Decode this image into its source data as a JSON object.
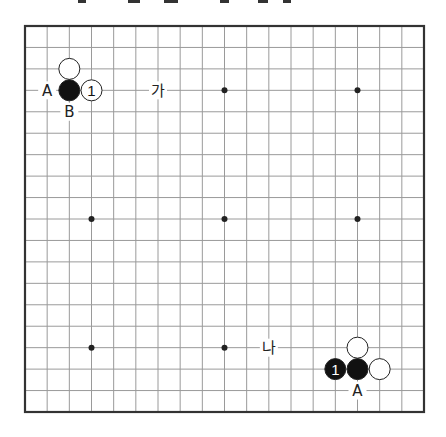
{
  "diagram": {
    "type": "go-board",
    "size": 19,
    "board": {
      "left": 25,
      "top": 26,
      "right": 424,
      "bottom": 412,
      "line_color": "#9a9a9a",
      "border_color": "#333333"
    },
    "star_points": [
      [
        3,
        3
      ],
      [
        9,
        3
      ],
      [
        15,
        3
      ],
      [
        3,
        9
      ],
      [
        9,
        9
      ],
      [
        15,
        9
      ],
      [
        3,
        15
      ],
      [
        9,
        15
      ],
      [
        15,
        15
      ]
    ],
    "stones": [
      {
        "col": 2,
        "row": 2,
        "color": "white",
        "label": ""
      },
      {
        "col": 2,
        "row": 3,
        "color": "black",
        "label": ""
      },
      {
        "col": 3,
        "row": 3,
        "color": "white",
        "label": "1"
      },
      {
        "col": 15,
        "row": 15,
        "color": "white",
        "label": ""
      },
      {
        "col": 14,
        "row": 16,
        "color": "black",
        "label": "1"
      },
      {
        "col": 15,
        "row": 16,
        "color": "black",
        "label": ""
      },
      {
        "col": 16,
        "row": 16,
        "color": "white",
        "label": ""
      }
    ],
    "markers": [
      {
        "col": 1,
        "row": 3,
        "text": "A"
      },
      {
        "col": 2,
        "row": 4,
        "text": "B"
      },
      {
        "col": 6,
        "row": 3,
        "text": "가"
      },
      {
        "col": 11,
        "row": 15,
        "text": "나"
      },
      {
        "col": 15,
        "row": 17,
        "text": "A"
      }
    ]
  },
  "top_fragments": [
    {
      "x": 78,
      "w": 8
    },
    {
      "x": 128,
      "w": 12
    },
    {
      "x": 164,
      "w": 14
    },
    {
      "x": 220,
      "w": 9
    },
    {
      "x": 258,
      "w": 10
    },
    {
      "x": 283,
      "w": 8
    }
  ]
}
